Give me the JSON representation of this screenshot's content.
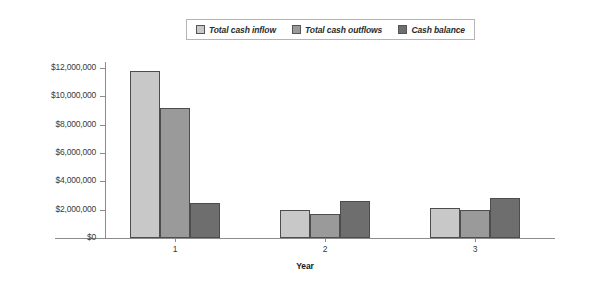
{
  "chart_data": {
    "type": "bar",
    "title": "",
    "xlabel": "Year",
    "ylabel": "",
    "categories": [
      "1",
      "2",
      "3"
    ],
    "series": [
      {
        "name": "Total cash inflow",
        "color": "#c8c8c8",
        "values": [
          11800000,
          1950000,
          2100000
        ]
      },
      {
        "name": "Total cash outflows",
        "color": "#9a9a9a",
        "values": [
          9150000,
          1700000,
          1950000
        ]
      },
      {
        "name": "Cash balance",
        "color": "#6e6e6e",
        "values": [
          2450000,
          2600000,
          2800000
        ]
      }
    ],
    "ylim": [
      0,
      12000000
    ],
    "y_ticks": [
      0,
      2000000,
      4000000,
      6000000,
      8000000,
      10000000,
      12000000
    ],
    "y_tick_labels": [
      "$0",
      "$2,000,000",
      "$4,000,000",
      "$6,000,000",
      "$8,000,000",
      "$10,000,000",
      "$12,000,000"
    ],
    "grid": false,
    "legend_position": "top-center"
  },
  "legend": {
    "entries": [
      {
        "label": "Total cash inflow"
      },
      {
        "label": "Total cash outflows"
      },
      {
        "label": "Cash balance"
      }
    ]
  },
  "axis": {
    "x_title": "Year"
  }
}
